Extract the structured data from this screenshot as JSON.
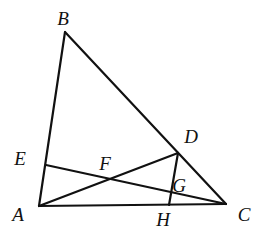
{
  "figure": {
    "type": "geometry-diagram",
    "width": 266,
    "height": 245,
    "background_color": "#ffffff",
    "stroke_color": "#111111",
    "stroke_width": 2.2,
    "points": {
      "A": {
        "label": "A",
        "x": 39,
        "y": 206,
        "label_x": 18,
        "label_y": 214
      },
      "B": {
        "label": "B",
        "x": 65,
        "y": 32,
        "label_x": 63,
        "label_y": 18
      },
      "C": {
        "label": "C",
        "x": 226,
        "y": 204,
        "label_x": 244,
        "label_y": 214
      },
      "D": {
        "label": "D",
        "x": 178,
        "y": 153,
        "label_x": 191,
        "label_y": 136
      },
      "E": {
        "label": "E",
        "x": 46,
        "y": 165,
        "label_x": 20,
        "label_y": 158
      },
      "F": {
        "label": "F",
        "x": 105,
        "y": 178,
        "label_x": 105,
        "label_y": 163
      },
      "G": {
        "label": "G",
        "x": 171,
        "y": 194,
        "label_x": 179,
        "label_y": 185
      },
      "H": {
        "label": "H",
        "x": 169,
        "y": 205,
        "label_x": 163,
        "label_y": 219
      }
    },
    "segments": [
      {
        "name": "segment-AB",
        "from": "A",
        "to": "B"
      },
      {
        "name": "segment-BC",
        "from": "B",
        "to": "C"
      },
      {
        "name": "segment-AC",
        "from": "A",
        "to": "C"
      },
      {
        "name": "segment-AD",
        "from": "A",
        "to": "D"
      },
      {
        "name": "segment-EC",
        "from": "E",
        "to": "C"
      },
      {
        "name": "segment-DH",
        "from": "D",
        "to": "H"
      }
    ],
    "labels_order": [
      "B",
      "D",
      "E",
      "F",
      "G",
      "A",
      "H",
      "C"
    ]
  }
}
